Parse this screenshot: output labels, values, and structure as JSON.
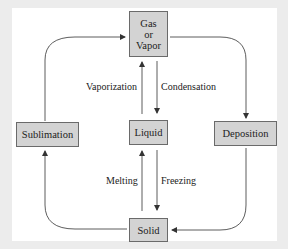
{
  "diagram": {
    "nodes": {
      "gas": {
        "line1": "Gas",
        "line2": "or",
        "line3": "Vapor"
      },
      "liquid": "Liquid",
      "solid": "Solid",
      "sublimation": "Sublimation",
      "deposition": "Deposition"
    },
    "edges": {
      "vaporization": "Vaporization",
      "condensation": "Condensation",
      "melting": "Melting",
      "freezing": "Freezing"
    },
    "colors": {
      "box_fill": "#d3d3d3",
      "box_border": "#6a6a6a",
      "line": "#333333",
      "background": "#ececec",
      "panel": "#ffffff"
    }
  }
}
